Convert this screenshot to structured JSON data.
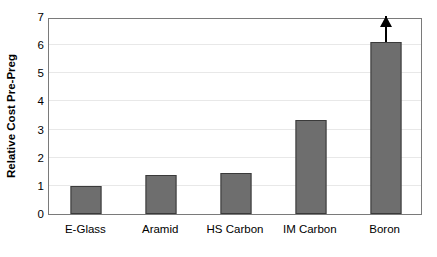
{
  "chart_data": {
    "type": "bar",
    "title": "",
    "xlabel": "",
    "ylabel": "Relative Cost Pre-Preg",
    "categories": [
      "E-Glass",
      "Aramid",
      "HS Carbon",
      "IM Carbon",
      "Boron"
    ],
    "values": [
      1.0,
      1.4,
      1.45,
      3.35,
      6.1
    ],
    "ylim": [
      0,
      7
    ],
    "yticks": [
      0,
      1,
      2,
      3,
      4,
      5,
      6,
      7
    ],
    "ytick_labels": [
      "0",
      "1",
      "2",
      "3",
      "4",
      "5",
      "6",
      "7"
    ],
    "grid": true,
    "legend": null,
    "annotations": [
      {
        "category": "Boron",
        "type": "up-arrow",
        "meaning": "value extends beyond axis"
      }
    ],
    "series": [
      {
        "name": "Relative Cost Pre-Preg",
        "values": [
          1.0,
          1.4,
          1.45,
          3.35,
          6.1
        ]
      }
    ],
    "colors": {
      "bar_fill": "#6e6e6e",
      "bar_border": "#3a3a3a",
      "gridline": "#e8e8e8",
      "axis_frame": "#7a7a7a",
      "background": "#ffffff",
      "text": "#000000",
      "arrow": "#000000"
    }
  }
}
